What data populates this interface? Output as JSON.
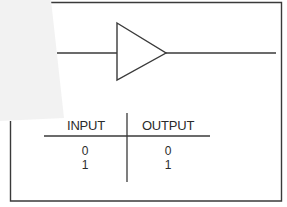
{
  "diagram": {
    "type": "logic-gate-buffer",
    "gate_symbol": "buffer-triangle-icon",
    "colors": {
      "line": "#3a3a3a",
      "background": "#ffffff",
      "overlay": "#f1f1f1"
    }
  },
  "truth_table": {
    "headers": [
      "INPUT",
      "OUTPUT"
    ],
    "rows": [
      {
        "input": "0",
        "output": "0"
      },
      {
        "input": "1",
        "output": "1"
      }
    ]
  }
}
